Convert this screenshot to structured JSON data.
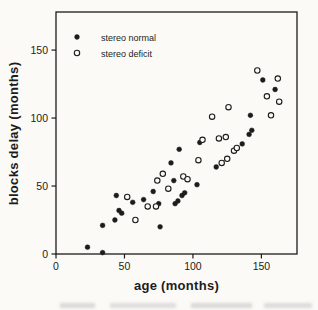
{
  "figure": {
    "background": "#fbfaf7",
    "ink": "#1c1c1c"
  },
  "chart_data": {
    "type": "scatter",
    "title": "",
    "xlabel": "age (months)",
    "ylabel": "blocks delay (months)",
    "xlim": [
      0,
      176
    ],
    "ylim": [
      0,
      178
    ],
    "x_ticks": [
      0,
      50,
      100,
      150
    ],
    "y_ticks": [
      0,
      50,
      100,
      150
    ],
    "grid": false,
    "legend_position": "top-left-inside",
    "series": [
      {
        "name": "stereo normal",
        "marker": "filled-circle",
        "color": "#1c1c1c",
        "points": [
          [
            23,
            5
          ],
          [
            34,
            1
          ],
          [
            34,
            21
          ],
          [
            43,
            25
          ],
          [
            44,
            43
          ],
          [
            46,
            32
          ],
          [
            48,
            30
          ],
          [
            56,
            38
          ],
          [
            64,
            40
          ],
          [
            71,
            46
          ],
          [
            75,
            37
          ],
          [
            76,
            20
          ],
          [
            84,
            67
          ],
          [
            86,
            54
          ],
          [
            87,
            37
          ],
          [
            89,
            39
          ],
          [
            90,
            77
          ],
          [
            92,
            43
          ],
          [
            94,
            45
          ],
          [
            103,
            51
          ],
          [
            105,
            82
          ],
          [
            117,
            64
          ],
          [
            136,
            81
          ],
          [
            141,
            88
          ],
          [
            143,
            91
          ],
          [
            142,
            102
          ],
          [
            151,
            128
          ],
          [
            160,
            121
          ]
        ]
      },
      {
        "name": "stereo deficit",
        "marker": "open-circle",
        "color": "#1c1c1c",
        "points": [
          [
            52,
            42
          ],
          [
            58,
            25
          ],
          [
            67,
            35
          ],
          [
            73,
            35
          ],
          [
            74,
            54
          ],
          [
            78,
            59
          ],
          [
            82,
            48
          ],
          [
            93,
            57
          ],
          [
            96,
            55
          ],
          [
            104,
            69
          ],
          [
            107,
            84
          ],
          [
            114,
            101
          ],
          [
            119,
            85
          ],
          [
            121,
            67
          ],
          [
            124,
            86
          ],
          [
            125,
            70
          ],
          [
            126,
            108
          ],
          [
            130,
            76
          ],
          [
            132,
            78
          ],
          [
            147,
            135
          ],
          [
            154,
            116
          ],
          [
            157,
            102
          ],
          [
            162,
            129
          ],
          [
            163,
            112
          ]
        ]
      }
    ]
  }
}
